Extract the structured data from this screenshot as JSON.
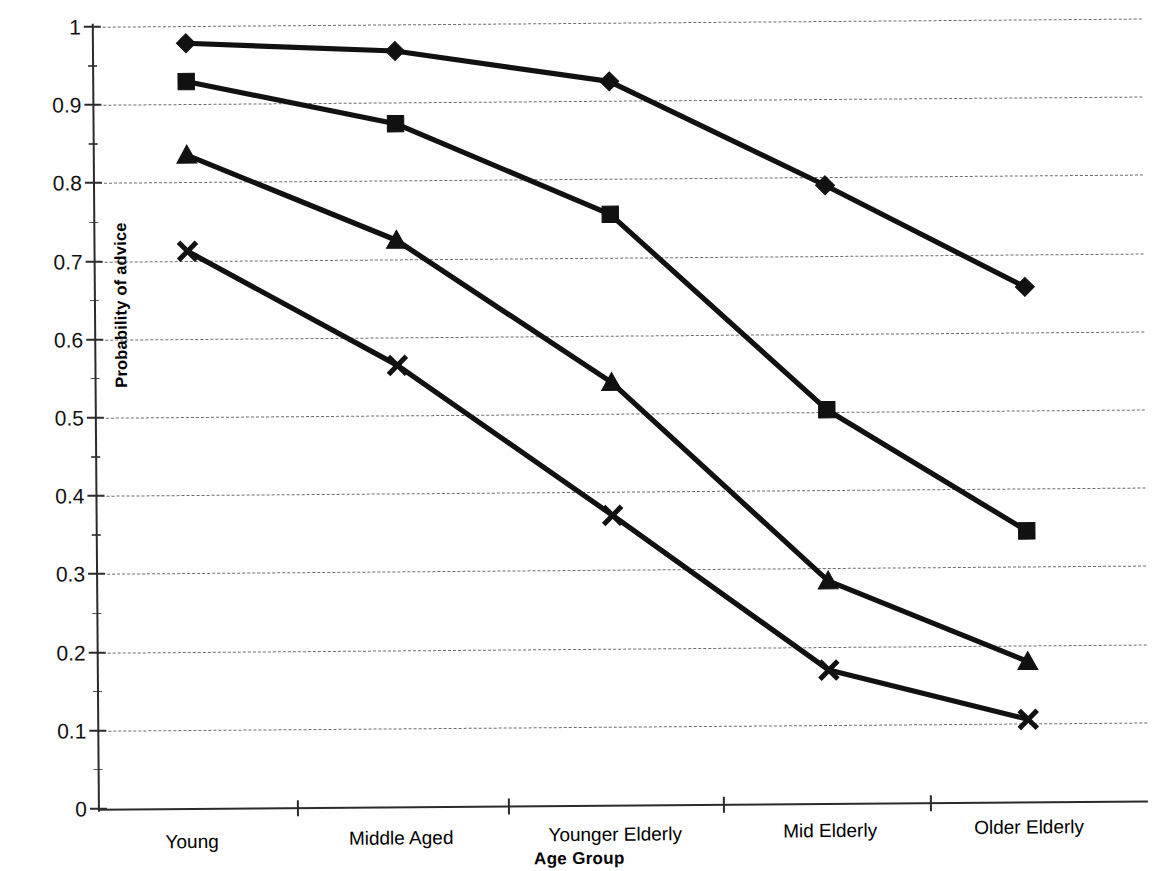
{
  "chart_data": {
    "type": "line",
    "title": "",
    "xlabel": "Age Group",
    "ylabel": "Probability of advice",
    "categories": [
      "Young",
      "Middle Aged",
      "Younger Elderly",
      "Mid Elderly",
      "Older Elderly"
    ],
    "ylim": [
      0,
      1
    ],
    "yticks": [
      "0",
      "0.1",
      "0.2",
      "0.3",
      "0.4",
      "0.5",
      "0.6",
      "0.7",
      "0.8",
      "0.9",
      "1"
    ],
    "ytick_values": [
      0,
      0.1,
      0.2,
      0.3,
      0.4,
      0.5,
      0.6,
      0.7,
      0.8,
      0.9,
      1
    ],
    "grid": "horizontal dotted",
    "legend": "none",
    "line_color": "#111111",
    "grid_color": "#555555",
    "series": [
      {
        "name": "Series 1",
        "marker": "diamond",
        "values": [
          0.978,
          0.966,
          0.925,
          0.79,
          0.658
        ]
      },
      {
        "name": "Series 2",
        "marker": "square",
        "values": [
          0.929,
          0.873,
          0.755,
          0.503,
          0.346
        ]
      },
      {
        "name": "Series 3",
        "marker": "triangle",
        "values": [
          0.835,
          0.724,
          0.54,
          0.284,
          0.179
        ]
      },
      {
        "name": "Series 4",
        "marker": "x",
        "values": [
          0.712,
          0.564,
          0.37,
          0.17,
          0.105
        ]
      }
    ]
  },
  "axis": {
    "y_title": "Probability of advice",
    "x_title": "Age Group"
  }
}
